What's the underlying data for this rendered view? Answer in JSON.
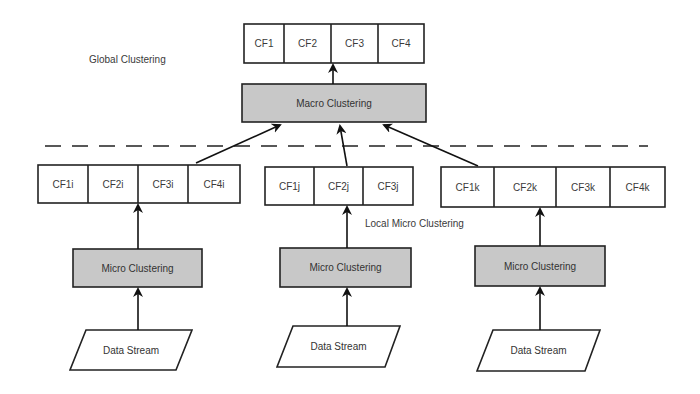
{
  "labels": {
    "global": "Global Clustering",
    "local": "Local Micro Clustering"
  },
  "global_cf": [
    "CF1",
    "CF2",
    "CF3",
    "CF4"
  ],
  "macro": {
    "label": "Macro Clustering"
  },
  "local_groups": [
    {
      "id": "i",
      "cf": [
        "CF1i",
        "CF2i",
        "CF3i",
        "CF4i"
      ],
      "micro": "Micro Clustering",
      "source": "Data Stream"
    },
    {
      "id": "j",
      "cf": [
        "CF1j",
        "CF2j",
        "CF3j"
      ],
      "micro": "Micro Clustering",
      "source": "Data Stream"
    },
    {
      "id": "k",
      "cf": [
        "CF1k",
        "CF2k",
        "CF3k",
        "CF4k"
      ],
      "micro": "Micro Clustering",
      "source": "Data Stream"
    }
  ],
  "colors": {
    "box_fill": "#ffffff",
    "process_fill": "#c8c8c8",
    "stroke": "#222222",
    "text": "#333333"
  }
}
